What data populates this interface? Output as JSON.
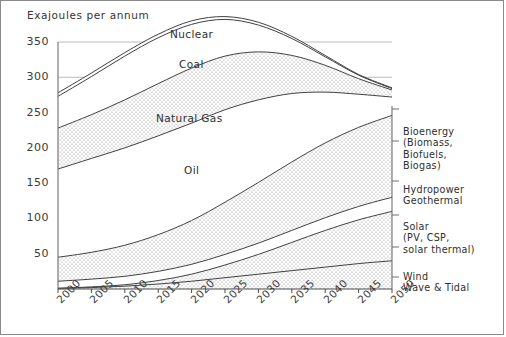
{
  "figure": {
    "axis_title": "Exajoules per annum",
    "frame_color": "#8a8a8a",
    "grid_color": "#b4b4b4",
    "line_color": "#404040",
    "stipple_color": "#7a7a7a"
  },
  "y_axis": {
    "ticks": [
      "50",
      "100",
      "150",
      "200",
      "250",
      "300",
      "350"
    ],
    "min": 0,
    "max": 370,
    "label": "Exajoules per annum"
  },
  "x_axis": {
    "ticks": [
      "2000",
      "2005",
      "2010",
      "2015",
      "2020",
      "2025",
      "2030",
      "2035",
      "2040",
      "2045",
      "2050"
    ]
  },
  "inline_labels": [
    {
      "text": "Nuclear",
      "x": 169,
      "y": 27
    },
    {
      "text": "Coal",
      "x": 178,
      "y": 57
    },
    {
      "text": "Natural Gas",
      "x": 155,
      "y": 111
    },
    {
      "text": "Oil",
      "x": 183,
      "y": 163
    }
  ],
  "right_labels": [
    {
      "text": "Bioenergy\n(Biomass,\nBiofuels,\nBiogas)",
      "x": 402,
      "y": 125
    },
    {
      "text": "Hydropower\nGeothermal",
      "x": 402,
      "y": 183
    },
    {
      "text": "Solar\n(PV, CSP,\nsolar thermal)",
      "x": 402,
      "y": 220
    },
    {
      "text": "Wind\nWave & Tidal",
      "x": 402,
      "y": 270
    }
  ],
  "chart_data": {
    "type": "area",
    "title": "",
    "subtitle": "",
    "xlabel": "",
    "ylabel": "Exajoules per annum",
    "ylim": [
      0,
      370
    ],
    "xlim": [
      2000,
      2050
    ],
    "grid": true,
    "stacked": true,
    "legend": "inline-and-right-margin",
    "x": [
      2000,
      2005,
      2010,
      2015,
      2020,
      2025,
      2030,
      2035,
      2040,
      2045,
      2050
    ],
    "series": [
      {
        "name": "Wind Wave & Tidal",
        "label_position": "right",
        "values": [
          1,
          2,
          4,
          7,
          11,
          16,
          21,
          26,
          31,
          36,
          40
        ]
      },
      {
        "name": "Solar (PV, CSP, solar thermal)",
        "label_position": "right",
        "values": [
          0,
          1,
          2,
          5,
          10,
          18,
          28,
          40,
          52,
          62,
          70
        ]
      },
      {
        "name": "Hydropower Geothermal",
        "label_position": "right",
        "values": [
          10,
          11,
          12,
          13,
          14,
          15,
          16,
          17,
          18,
          19,
          20
        ]
      },
      {
        "name": "Bioenergy (Biomass, Biofuels, Biogas)",
        "label_position": "right",
        "values": [
          34,
          38,
          44,
          52,
          62,
          74,
          86,
          97,
          106,
          112,
          116
        ]
      },
      {
        "name": "Oil",
        "label_position": "inline",
        "values": [
          125,
          133,
          138,
          140,
          138,
          131,
          117,
          97,
          72,
          47,
          26
        ]
      },
      {
        "name": "Natural Gas",
        "label_position": "inline",
        "values": [
          58,
          62,
          68,
          74,
          78,
          76,
          68,
          54,
          38,
          22,
          10
        ]
      },
      {
        "name": "Coal",
        "label_position": "inline",
        "values": [
          45,
          54,
          62,
          65,
          62,
          52,
          38,
          24,
          12,
          5,
          2
        ]
      },
      {
        "name": "Nuclear",
        "label_position": "inline",
        "values": [
          5,
          5,
          5,
          5,
          5,
          4,
          4,
          3,
          2,
          1,
          1
        ]
      }
    ],
    "stack_order_bottom_to_top": [
      "Wind Wave & Tidal",
      "Solar (PV, CSP, solar thermal)",
      "Hydropower Geothermal",
      "Bioenergy (Biomass, Biofuels, Biogas)",
      "Oil",
      "Natural Gas",
      "Coal",
      "Nuclear"
    ],
    "totals": [
      278,
      306,
      335,
      351,
      380,
      386,
      378,
      358,
      331,
      304,
      285
    ]
  }
}
